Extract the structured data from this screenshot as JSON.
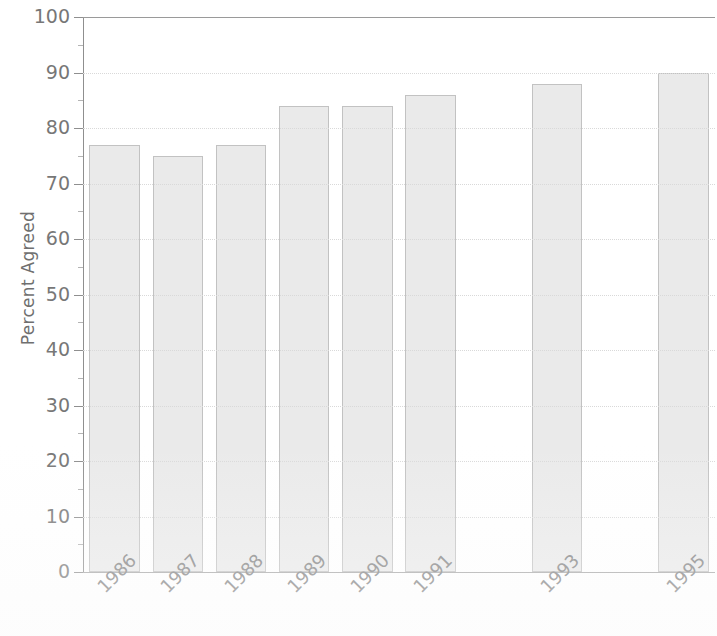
{
  "chart_data": {
    "type": "bar",
    "title": "",
    "subtitle": "",
    "xlabel": "",
    "ylabel": "Percent Agreed",
    "categories": [
      "1986",
      "1987",
      "1988",
      "1989",
      "1990",
      "1991",
      "1992",
      "1993",
      "1994",
      "1995"
    ],
    "values": [
      77,
      75,
      77,
      84,
      84,
      86,
      null,
      88,
      null,
      90
    ],
    "ylim": [
      0,
      100
    ],
    "ytick_labels": [
      "0",
      "10",
      "20",
      "30",
      "40",
      "50",
      "60",
      "70",
      "80",
      "90",
      "100"
    ],
    "ytick_values": [
      0,
      10,
      20,
      30,
      40,
      50,
      60,
      70,
      80,
      90,
      100
    ],
    "xtick_labels_shown": [
      "1986",
      "1987",
      "1988",
      "1989",
      "1990",
      "1991",
      "1993",
      "1995"
    ],
    "grid": true,
    "grid_axis": "y",
    "legend": false,
    "legend_position": "none",
    "bar_fill_color": "#eaeaea",
    "bar_border_color": "#c2c2c2",
    "gridline_color": "#d9d9d9",
    "axis_color": "#8f8f8f",
    "text_color": "#777777",
    "background_color": "#ffffff",
    "xtick_label_rotation": -45
  }
}
